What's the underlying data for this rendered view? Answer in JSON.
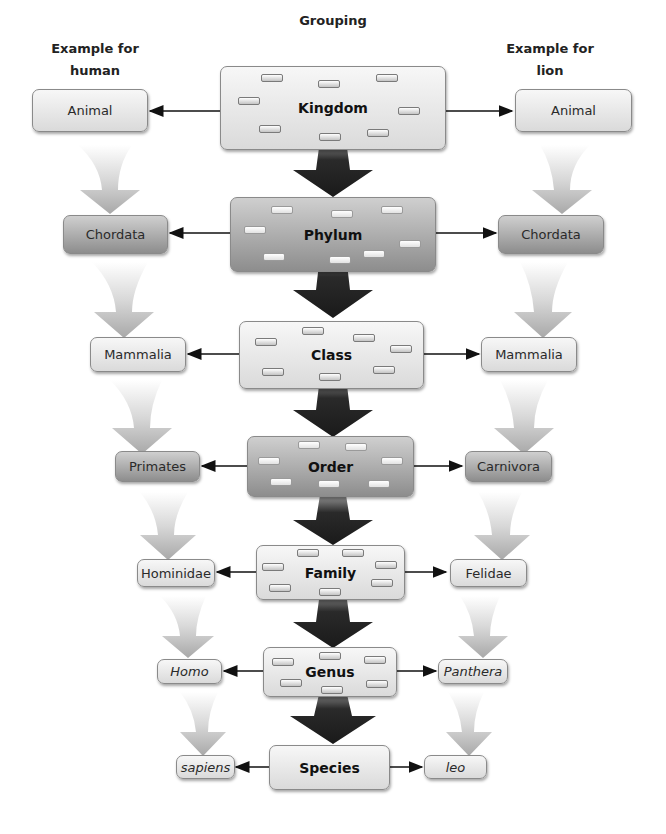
{
  "headers": {
    "left": "Example for human",
    "center": "Grouping",
    "right": "Example for lion"
  },
  "rows": [
    {
      "rank": "Kingdom",
      "human": "Animal",
      "lion": "Animal",
      "italic": false
    },
    {
      "rank": "Phylum",
      "human": "Chordata",
      "lion": "Chordata",
      "italic": false
    },
    {
      "rank": "Class",
      "human": "Mammalia",
      "lion": "Mammalia",
      "italic": false
    },
    {
      "rank": "Order",
      "human": "Primates",
      "lion": "Carnivora",
      "italic": false
    },
    {
      "rank": "Family",
      "human": "Hominidae",
      "lion": "Felidae",
      "italic": false
    },
    {
      "rank": "Genus",
      "human": "Homo",
      "lion": "Panthera",
      "italic": true
    },
    {
      "rank": "Species",
      "human": "sapiens",
      "lion": "leo",
      "italic": true
    }
  ],
  "colors": {
    "light_box": "#e8e8e8",
    "dark_box": "#aaaaaa",
    "center_arrow": "#2a2a2a",
    "side_arrow": "#bbbbbb",
    "connector": "#111111"
  }
}
